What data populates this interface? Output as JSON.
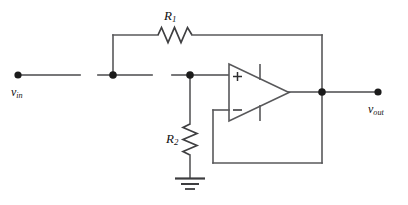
{
  "diagram": {
    "background_color": "#ffffff",
    "wire_color": "#58585a",
    "node_color": "#1b1b1b"
  },
  "labels": {
    "r1": {
      "symbol": "R",
      "subscript": "1"
    },
    "r2": {
      "symbol": "R",
      "subscript": "2"
    },
    "vin": {
      "symbol": "v",
      "subscript": "in"
    },
    "vout": {
      "symbol": "v",
      "subscript": "out"
    }
  },
  "components": {
    "resistor_r1": {
      "name": "R1",
      "orientation": "horizontal",
      "icon": "resistor-zigzag-icon"
    },
    "resistor_r2": {
      "name": "R2",
      "orientation": "vertical",
      "icon": "resistor-zigzag-icon"
    },
    "opamp": {
      "name": "operational-amplifier",
      "icon": "opamp-triangle-icon",
      "plus_input": "+",
      "minus_input": "−"
    },
    "ground": {
      "name": "ground",
      "icon": "ground-icon",
      "bars": 3
    }
  },
  "terminals": {
    "input": {
      "name": "vin-terminal",
      "icon": "terminal-dot-icon"
    },
    "output": {
      "name": "vout-terminal",
      "icon": "terminal-dot-icon"
    }
  },
  "nodes": [
    {
      "name": "input-branch-node",
      "icon": "junction-dot-icon"
    },
    {
      "name": "noninverting-input-node",
      "icon": "junction-dot-icon"
    },
    {
      "name": "output-node",
      "icon": "junction-dot-icon"
    }
  ]
}
